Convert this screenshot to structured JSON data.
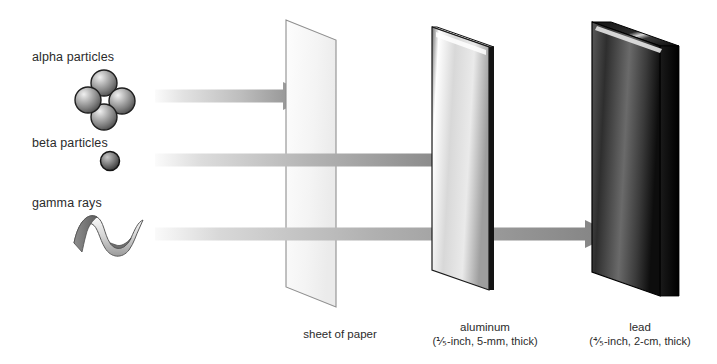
{
  "diagram": {
    "background": "#ffffff",
    "text_color": "#2b2b2b"
  },
  "radiation": [
    {
      "id": "alpha",
      "label": "alpha particles",
      "symbol": "four-sphere-cluster",
      "stopped_by": "sheet of paper",
      "arrow": {
        "x_start": 155,
        "x_end": 310,
        "y": 96,
        "thickness": 13
      }
    },
    {
      "id": "beta",
      "label": "beta particles",
      "symbol": "single-sphere",
      "stopped_by": "aluminum",
      "arrow": {
        "x_start": 155,
        "x_end": 462,
        "y": 160,
        "thickness": 13
      }
    },
    {
      "id": "gamma",
      "label": "gamma rays",
      "symbol": "wave-ribbon",
      "stopped_by": "lead",
      "arrow": {
        "x_start": 155,
        "x_end": 613,
        "y": 234,
        "thickness": 13
      }
    }
  ],
  "barriers": [
    {
      "id": "paper",
      "name": "sheet of paper",
      "detail": "",
      "caption_x": 340,
      "caption_y": 328,
      "fill_light": "#fbfbfb",
      "fill_dark": "#efefef",
      "edge": "#8a8a8a"
    },
    {
      "id": "aluminum",
      "name": "aluminum",
      "detail": "(⅕-inch, 5-mm, thick)",
      "caption_x": 485,
      "caption_y": 320,
      "fill_light": "#ffffff",
      "fill_dark": "#9a9a9a",
      "edge": "#141414"
    },
    {
      "id": "lead",
      "name": "lead",
      "detail": "(⅘-inch, 2-cm, thick)",
      "caption_x": 640,
      "caption_y": 320,
      "fill_light": "#c9c9c9",
      "fill_dark": "#111111",
      "edge": "#000000"
    }
  ],
  "arrow_colors": {
    "gradient_start": "#f7f7f7",
    "gradient_mid": "#c0c0c0",
    "gradient_end": "#808080",
    "head": "#808080"
  },
  "particle_colors": {
    "sphere_highlight": "#e8e8e8",
    "sphere_mid": "#9d9d9d",
    "sphere_dark": "#3c3c3c",
    "outline": "#1a1a1a",
    "ribbon_light": "#f2f2f2",
    "ribbon_dark": "#7d7d7d"
  }
}
